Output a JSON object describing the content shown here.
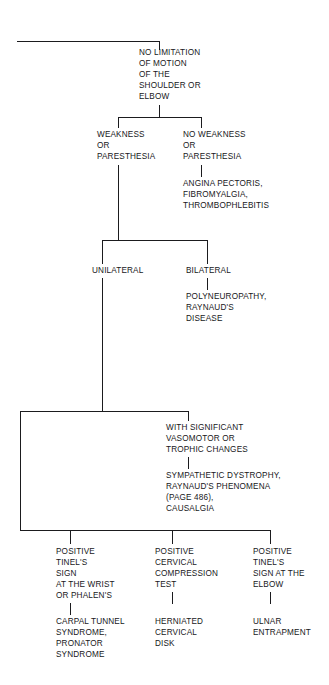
{
  "diagram": {
    "root": {
      "id": "no-limitation",
      "label": "NO LIMITATION\nOF MOTION\nOF THE\nSHOULDER OR\nELBOW"
    },
    "nodes": {
      "weakness": {
        "label": "WEAKNESS\nOR\nPARESTHESIA"
      },
      "no_weakness": {
        "label": "NO WEAKNESS\nOR\nPARESTHESIA"
      },
      "no_weakness_dx": {
        "label": "ANGINA PECTORIS,\nFIBROMYALGIA,\nTHROMBOPHLEBITIS"
      },
      "unilateral": {
        "label": "UNILATERAL"
      },
      "bilateral": {
        "label": "BILATERAL"
      },
      "bilateral_dx": {
        "label": "POLYNEUROPATHY,\nRAYNAUD'S\nDISEASE"
      },
      "vasomotor": {
        "label": "WITH SIGNIFICANT\nVASOMOTOR OR\nTROPHIC CHANGES"
      },
      "vasomotor_dx": {
        "label": "SYMPATHETIC DYSTROPHY,\nRAYNAUD'S PHENOMENA\n(PAGE 486),\nCAUSALGIA"
      },
      "tinel_wrist": {
        "label": "POSITIVE\nTINEL'S\nSIGN\nAT THE WRIST\nOR PHALEN'S"
      },
      "tinel_wrist_dx": {
        "label": "CARPAL TUNNEL\nSYNDROME,\nPRONATOR\nSYNDROME"
      },
      "cervical_test": {
        "label": "POSITIVE\nCERVICAL\nCOMPRESSION\nTEST"
      },
      "cervical_test_dx": {
        "label": "HERNIATED\nCERVICAL\nDISK"
      },
      "tinel_elbow": {
        "label": "POSITIVE\nTINEL'S\nSIGN AT THE\nELBOW"
      },
      "tinel_elbow_dx": {
        "label": "ULNAR\nENTRAPMENT"
      }
    },
    "colors": {
      "ink": "#17171a",
      "line": "#1b1b1e",
      "background": "#ffffff"
    }
  }
}
